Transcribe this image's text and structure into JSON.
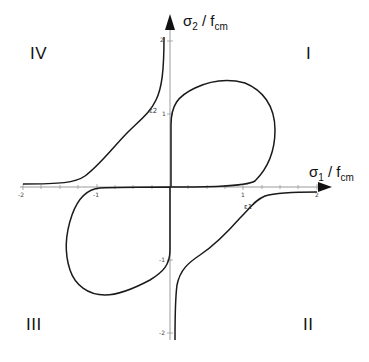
{
  "diagram": {
    "axes": {
      "x_label_main": "σ",
      "x_label_sub": "1",
      "x_label_rest": " / f",
      "x_label_rest_sub": "cm",
      "y_label_main": "σ",
      "y_label_sub": "2",
      "y_label_rest": " / f",
      "y_label_rest_sub": "cm",
      "x_ticks": [
        "-2",
        "-1",
        "1",
        "2"
      ],
      "y_ticks": [
        "2",
        "1",
        "-1",
        "-2"
      ]
    },
    "quadrants": {
      "q1": "I",
      "q2": "II",
      "q3": "III",
      "q4": "IV"
    },
    "strain_labels": {
      "e1": "ε1",
      "e2": "ε2"
    },
    "colors": {
      "curve": "#1a1a1a",
      "axis": "#111111",
      "grid_axis": "#999999"
    }
  }
}
